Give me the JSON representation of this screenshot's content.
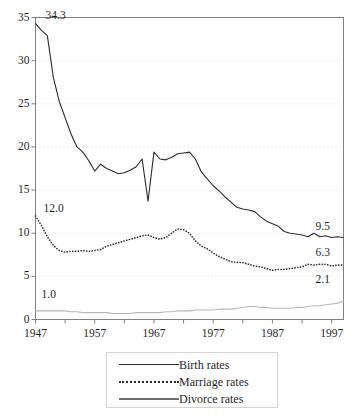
{
  "chart_data": {
    "type": "line",
    "title": "",
    "xlabel": "",
    "ylabel": "",
    "xlim": [
      1947,
      1999
    ],
    "ylim": [
      0,
      35
    ],
    "ytick_labels": [
      "0",
      "5",
      "10",
      "15",
      "20",
      "25",
      "30",
      "35"
    ],
    "ytick_values": [
      0,
      5,
      10,
      15,
      20,
      25,
      30,
      35
    ],
    "xtick_labels": [
      "1947",
      "1957",
      "1967",
      "1977",
      "1987",
      "1997"
    ],
    "xtick_values": [
      1947,
      1957,
      1967,
      1977,
      1987,
      1997
    ],
    "minor_xtick_values": [
      1952,
      1962,
      1972,
      1982,
      1992
    ],
    "grid": "horizontal-dotted",
    "legend_position": "bottom-center",
    "annotations": [
      {
        "name": "birth-start",
        "text": "34.3",
        "x": 1947,
        "y": 34.3
      },
      {
        "name": "marriage-start",
        "text": "12.0",
        "x": 1947,
        "y": 12.0
      },
      {
        "name": "divorce-start",
        "text": "1.0",
        "x": 1947,
        "y": 1.0
      },
      {
        "name": "birth-end",
        "text": "9.5",
        "x": 1999,
        "y": 9.5
      },
      {
        "name": "marriage-end",
        "text": "6.3",
        "x": 1999,
        "y": 6.3
      },
      {
        "name": "divorce-end",
        "text": "2.1",
        "x": 1999,
        "y": 2.1
      }
    ],
    "x": [
      1947,
      1948,
      1949,
      1950,
      1951,
      1952,
      1953,
      1954,
      1955,
      1956,
      1957,
      1958,
      1959,
      1960,
      1961,
      1962,
      1963,
      1964,
      1965,
      1966,
      1967,
      1968,
      1969,
      1970,
      1971,
      1972,
      1973,
      1974,
      1975,
      1976,
      1977,
      1978,
      1979,
      1980,
      1981,
      1982,
      1983,
      1984,
      1985,
      1986,
      1987,
      1988,
      1989,
      1990,
      1991,
      1992,
      1993,
      1994,
      1995,
      1996,
      1997,
      1998,
      1999
    ],
    "series": [
      {
        "name": "Birth rates",
        "style": "solid",
        "color": "#2b2b2b",
        "values": [
          34.3,
          33.5,
          32.9,
          28.1,
          25.3,
          23.4,
          21.5,
          20.0,
          19.4,
          18.4,
          17.2,
          18.0,
          17.5,
          17.2,
          16.9,
          17.0,
          17.3,
          17.7,
          18.6,
          13.7,
          19.4,
          18.6,
          18.5,
          18.8,
          19.2,
          19.3,
          19.4,
          18.6,
          17.1,
          16.3,
          15.5,
          14.9,
          14.2,
          13.6,
          13.0,
          12.8,
          12.7,
          12.5,
          11.9,
          11.4,
          11.1,
          10.8,
          10.2,
          10.0,
          9.9,
          9.8,
          9.6,
          10.0,
          9.6,
          9.7,
          9.5,
          9.6,
          9.5
        ]
      },
      {
        "name": "Marriage rates",
        "style": "dotted",
        "color": "#2b2b2b",
        "values": [
          12.0,
          10.9,
          9.6,
          8.6,
          8.0,
          7.8,
          7.9,
          7.9,
          8.0,
          7.9,
          8.0,
          8.1,
          8.5,
          8.7,
          8.9,
          9.1,
          9.3,
          9.5,
          9.7,
          9.8,
          9.5,
          9.3,
          9.5,
          10.0,
          10.5,
          10.4,
          10.0,
          9.1,
          8.5,
          8.2,
          7.7,
          7.3,
          7.0,
          6.7,
          6.6,
          6.6,
          6.4,
          6.2,
          6.1,
          5.9,
          5.7,
          5.8,
          5.8,
          5.9,
          6.0,
          6.1,
          6.4,
          6.3,
          6.4,
          6.4,
          6.2,
          6.3,
          6.3
        ]
      },
      {
        "name": "Divorce rates",
        "style": "solid",
        "color": "#b8b8b8",
        "values": [
          1.0,
          1.0,
          1.0,
          1.0,
          1.0,
          1.0,
          0.9,
          0.9,
          0.8,
          0.8,
          0.8,
          0.8,
          0.8,
          0.7,
          0.7,
          0.7,
          0.7,
          0.8,
          0.8,
          0.8,
          0.8,
          0.8,
          0.9,
          0.9,
          1.0,
          1.0,
          1.0,
          1.1,
          1.1,
          1.1,
          1.1,
          1.2,
          1.2,
          1.2,
          1.3,
          1.4,
          1.5,
          1.5,
          1.4,
          1.4,
          1.3,
          1.3,
          1.3,
          1.3,
          1.4,
          1.4,
          1.5,
          1.6,
          1.6,
          1.7,
          1.8,
          1.9,
          2.1
        ]
      }
    ]
  },
  "legend": {
    "items": [
      {
        "label_first": "Birth",
        "label_second": "rates",
        "key": "solid-line-key"
      },
      {
        "label_first": "Marriage",
        "label_second": "rates",
        "key": "dotted-line-key"
      },
      {
        "label_first": "Divorce",
        "label_second": "rates",
        "key": "thick-line-key"
      }
    ]
  },
  "caption": {
    "text": ""
  }
}
